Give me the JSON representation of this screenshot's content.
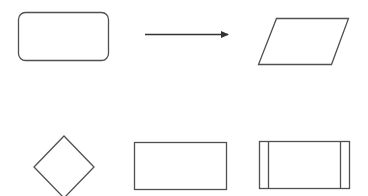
{
  "diagram": {
    "title": "Flowchart shape legend",
    "stroke_color": "#505050",
    "background": "#ffffff",
    "shapes": [
      {
        "id": "terminator",
        "type": "rounded-rectangle",
        "x": 18.5,
        "y": 12.5,
        "w": 90,
        "h": 48,
        "rx": 7
      },
      {
        "id": "flow-arrow",
        "type": "arrow",
        "x1": 145,
        "y1": 34.5,
        "x2": 228,
        "y2": 34.5
      },
      {
        "id": "data-io",
        "type": "parallelogram",
        "points": "276.5,18.5 348.5,18.5 331.5,64.5 258.5,64.5"
      },
      {
        "id": "decision",
        "type": "diamond",
        "points": "64,136 94,167 64,198 34,167"
      },
      {
        "id": "process",
        "type": "rectangle",
        "x": 134.5,
        "y": 142.5,
        "w": 92,
        "h": 47
      },
      {
        "id": "predefined-process",
        "type": "predefined-process",
        "x": 259.5,
        "y": 141.5,
        "w": 90,
        "h": 47,
        "inner_left_x": 268.5,
        "inner_right_x": 340.5
      }
    ]
  }
}
